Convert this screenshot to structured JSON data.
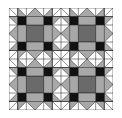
{
  "image": {
    "description": "Quilt pattern: 2x2 repeat of a star block",
    "rows": 2,
    "cols": 2
  },
  "colors": {
    "background": "#ffffff",
    "light_gray": "#a8a8a8",
    "dark_gray": "#6a6a6a",
    "black": "#111111",
    "line": "#222222"
  },
  "blocks": [
    {
      "row": 0,
      "col": 0
    },
    {
      "row": 0,
      "col": 1
    },
    {
      "row": 1,
      "col": 0
    },
    {
      "row": 1,
      "col": 1
    }
  ]
}
